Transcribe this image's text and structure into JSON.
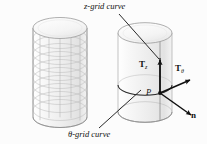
{
  "figure": {
    "background_color": "#fcfcfc",
    "ink_color": "#111111",
    "surface_fill": "#f2f2f2",
    "grid_color": "#b9b9b9"
  },
  "labels": {
    "z_grid_curve": "z-grid curve",
    "theta_grid_curve": "θ-grid curve",
    "tangent_z": "T",
    "tangent_z_sub": "z",
    "tangent_theta": "T",
    "tangent_theta_sub": "θ",
    "point": "P",
    "normal": "n"
  },
  "left_object": {
    "name": "gridded-cylinder",
    "description": "cylinder covered by a full quadrilateral mesh of theta-grid and z-grid curves",
    "theta_divisions": 12,
    "z_divisions": 11
  },
  "right_object": {
    "name": "tangent-vector-cylinder",
    "description": "cylinder showing one z-grid curve, one theta-grid curve, point P, tangent vectors and normal",
    "vectors": [
      "T_z",
      "T_theta",
      "n"
    ],
    "point": "P"
  },
  "leader_lines": {
    "z_grid_leader": "from z-grid curve label down-right to vertical grid line on cylinder",
    "theta_grid_leader": "from theta-grid curve label up-right to middle ellipse"
  }
}
